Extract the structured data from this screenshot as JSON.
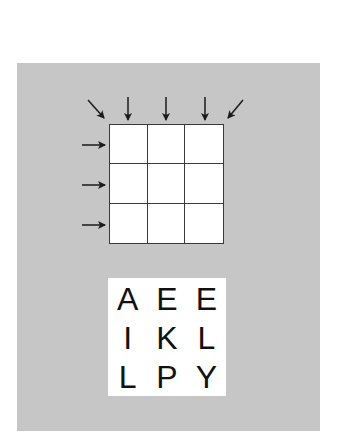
{
  "figure": {
    "background_color": "#ffffff",
    "panel_color": "#c6c6c6",
    "line_color": "#3a3a3a",
    "arrow_color": "#1a1a1a"
  },
  "grid": {
    "rows": 3,
    "cols": 3,
    "cells": [
      [
        "",
        "",
        ""
      ],
      [
        "",
        "",
        ""
      ],
      [
        "",
        "",
        ""
      ]
    ]
  },
  "arrows": {
    "top": [
      {
        "direction": "down-right",
        "target": "diagonal-main"
      },
      {
        "direction": "down",
        "target": "column-1"
      },
      {
        "direction": "down",
        "target": "column-2"
      },
      {
        "direction": "down",
        "target": "column-3"
      },
      {
        "direction": "down-left",
        "target": "diagonal-anti"
      }
    ],
    "left": [
      {
        "direction": "right",
        "target": "row-1"
      },
      {
        "direction": "right",
        "target": "row-2"
      },
      {
        "direction": "right",
        "target": "row-3"
      }
    ]
  },
  "letters": {
    "rows": [
      [
        "A",
        "E",
        "E"
      ],
      [
        "I",
        "K",
        "L"
      ],
      [
        "L",
        "P",
        "Y"
      ]
    ]
  }
}
